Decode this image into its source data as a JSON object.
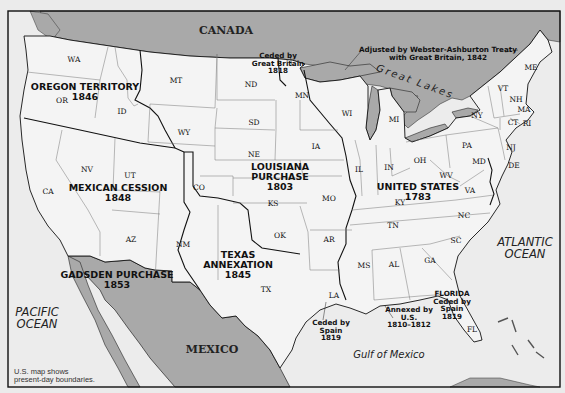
{
  "map": {
    "frame": {
      "x": 8,
      "y": 11,
      "w": 552,
      "h": 376
    },
    "colors": {
      "land_us": "#f4f4f4",
      "land_foreign": "#a9a9a9",
      "water": "#ececec",
      "border": "#111111",
      "state_line": "#777777"
    },
    "countries": [
      {
        "id": "canada",
        "label": "CANADA",
        "x": 226,
        "y": 31
      },
      {
        "id": "mexico",
        "label": "MEXICO",
        "x": 212,
        "y": 350
      }
    ],
    "water_labels": [
      {
        "id": "pacific-ocean",
        "lines": [
          "PACIFIC",
          "OCEAN"
        ],
        "x": 37,
        "y": 318
      },
      {
        "id": "atlantic-ocean",
        "lines": [
          "ATLANTIC",
          "OCEAN"
        ],
        "x": 525,
        "y": 248
      },
      {
        "id": "gulf-of-mexico",
        "lines": [
          "Gulf of Mexico"
        ],
        "x": 389,
        "y": 355
      },
      {
        "id": "great-lakes",
        "lines": [
          "Great Lakes"
        ],
        "x": 415,
        "y": 82
      }
    ],
    "territories": [
      {
        "id": "oregon-territory",
        "lines": [
          "OREGON TERRITORY",
          "1846"
        ],
        "x": 85,
        "y": 92
      },
      {
        "id": "louisiana-purchase",
        "lines": [
          "LOUISIANA",
          "PURCHASE",
          "1803"
        ],
        "x": 280,
        "y": 177
      },
      {
        "id": "mexican-cession",
        "lines": [
          "MEXICAN CESSION",
          "1848"
        ],
        "x": 118,
        "y": 193
      },
      {
        "id": "united-states-1783",
        "lines": [
          "UNITED STATES",
          "1783"
        ],
        "x": 418,
        "y": 192
      },
      {
        "id": "texas-annexation",
        "lines": [
          "TEXAS",
          "ANNEXATION",
          "1845"
        ],
        "x": 238,
        "y": 265
      },
      {
        "id": "gadsden-purchase",
        "lines": [
          "GADSDEN PURCHASE",
          "1853"
        ],
        "x": 117,
        "y": 280
      }
    ],
    "notes": [
      {
        "id": "ceded-by-great-britain",
        "lines": [
          "Ceded by",
          "Great Britain",
          "1818"
        ],
        "x": 278,
        "y": 63
      },
      {
        "id": "webster-ashburton",
        "lines": [
          "Adjusted by Webster-Ashburton Treaty",
          "with Great Britain, 1842"
        ],
        "x": 438,
        "y": 54
      },
      {
        "id": "ceded-by-spain-1819-west",
        "lines": [
          "Ceded by",
          "Spain",
          "1819"
        ],
        "x": 331,
        "y": 330
      },
      {
        "id": "annexed-by-us",
        "lines": [
          "Annexed by",
          "U.S.",
          "1810–1812"
        ],
        "x": 409,
        "y": 317
      },
      {
        "id": "florida-ceded-by-spain",
        "lines": [
          "FLORIDA",
          "Ceded by",
          "Spain",
          "1819"
        ],
        "x": 452,
        "y": 305
      }
    ],
    "states": [
      {
        "abbr": "WA",
        "x": 74,
        "y": 60
      },
      {
        "abbr": "OR",
        "x": 62,
        "y": 101
      },
      {
        "abbr": "MT",
        "x": 176,
        "y": 81
      },
      {
        "abbr": "ID",
        "x": 122,
        "y": 112
      },
      {
        "abbr": "WY",
        "x": 184,
        "y": 133
      },
      {
        "abbr": "ND",
        "x": 251,
        "y": 85
      },
      {
        "abbr": "SD",
        "x": 254,
        "y": 123
      },
      {
        "abbr": "NE",
        "x": 254,
        "y": 155
      },
      {
        "abbr": "MN",
        "x": 302,
        "y": 96
      },
      {
        "abbr": "WI",
        "x": 347,
        "y": 114
      },
      {
        "abbr": "MI",
        "x": 394,
        "y": 120
      },
      {
        "abbr": "IA",
        "x": 316,
        "y": 147
      },
      {
        "abbr": "IL",
        "x": 359,
        "y": 170
      },
      {
        "abbr": "IN",
        "x": 389,
        "y": 168
      },
      {
        "abbr": "OH",
        "x": 420,
        "y": 161
      },
      {
        "abbr": "PA",
        "x": 467,
        "y": 146
      },
      {
        "abbr": "NY",
        "x": 477,
        "y": 116
      },
      {
        "abbr": "VT",
        "x": 503,
        "y": 89
      },
      {
        "abbr": "NH",
        "x": 516,
        "y": 100
      },
      {
        "abbr": "ME",
        "x": 531,
        "y": 68
      },
      {
        "abbr": "MA",
        "x": 524,
        "y": 110
      },
      {
        "abbr": "CT",
        "x": 513,
        "y": 123
      },
      {
        "abbr": "RI",
        "x": 527,
        "y": 124
      },
      {
        "abbr": "NJ",
        "x": 511,
        "y": 148
      },
      {
        "abbr": "DE",
        "x": 514,
        "y": 166
      },
      {
        "abbr": "MD",
        "x": 479,
        "y": 162
      },
      {
        "abbr": "WV",
        "x": 446,
        "y": 176
      },
      {
        "abbr": "VA",
        "x": 470,
        "y": 191
      },
      {
        "abbr": "KY",
        "x": 400,
        "y": 203
      },
      {
        "abbr": "TN",
        "x": 393,
        "y": 226
      },
      {
        "abbr": "NC",
        "x": 464,
        "y": 216
      },
      {
        "abbr": "SC",
        "x": 456,
        "y": 241
      },
      {
        "abbr": "GA",
        "x": 430,
        "y": 261
      },
      {
        "abbr": "AL",
        "x": 394,
        "y": 265
      },
      {
        "abbr": "MS",
        "x": 364,
        "y": 266
      },
      {
        "abbr": "LA",
        "x": 334,
        "y": 296
      },
      {
        "abbr": "FL",
        "x": 472,
        "y": 330
      },
      {
        "abbr": "AR",
        "x": 329,
        "y": 240
      },
      {
        "abbr": "MO",
        "x": 329,
        "y": 199
      },
      {
        "abbr": "KS",
        "x": 273,
        "y": 204
      },
      {
        "abbr": "OK",
        "x": 280,
        "y": 236
      },
      {
        "abbr": "TX",
        "x": 266,
        "y": 290
      },
      {
        "abbr": "CO",
        "x": 199,
        "y": 188
      },
      {
        "abbr": "NM",
        "x": 183,
        "y": 245
      },
      {
        "abbr": "AZ",
        "x": 131,
        "y": 240
      },
      {
        "abbr": "UT",
        "x": 130,
        "y": 176
      },
      {
        "abbr": "NV",
        "x": 87,
        "y": 170
      },
      {
        "abbr": "CA",
        "x": 48,
        "y": 192
      }
    ],
    "caption": [
      "U.S. map shows",
      "present-day boundaries."
    ]
  }
}
